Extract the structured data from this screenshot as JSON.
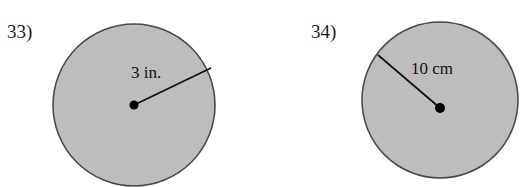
{
  "page": {
    "width": 527,
    "height": 187,
    "background_color": "#ffffff",
    "clipped_instruction": "in. Include the correct units."
  },
  "style": {
    "circle_fill": "#bdbdbd",
    "circle_stroke": "#4a4a4a",
    "radius_line_color": "#111111",
    "center_dot_color": "#000000",
    "text_color": "#1c1c1c"
  },
  "problems": [
    {
      "id": "33",
      "number_label": "33)",
      "shape": "circle",
      "measure_type": "radius",
      "dimension_label": "3 in.",
      "value": 3,
      "unit": "in.",
      "circle": {
        "cx": 134,
        "cy": 105,
        "r": 81
      },
      "center_dot": {
        "cx": 134,
        "cy": 105,
        "r": 4.5
      },
      "radius_line": {
        "x1": 134,
        "y1": 105,
        "x2": 211,
        "y2": 68
      }
    },
    {
      "id": "34",
      "number_label": "34)",
      "shape": "circle",
      "measure_type": "radius",
      "dimension_label": "10 cm",
      "value": 10,
      "unit": "cm",
      "circle": {
        "cx": 440,
        "cy": 100,
        "r": 78
      },
      "center_dot": {
        "cx": 440,
        "cy": 108,
        "r": 5
      },
      "radius_line": {
        "x1": 440,
        "y1": 108,
        "x2": 378,
        "y2": 55
      }
    }
  ]
}
